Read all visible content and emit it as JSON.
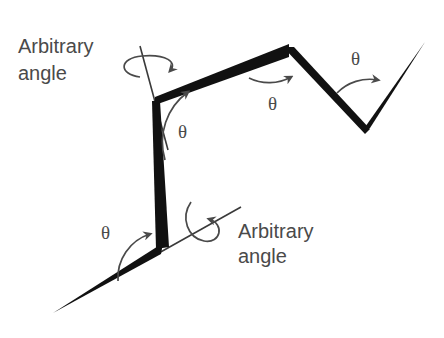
{
  "figure": {
    "background_color": "#ffffff",
    "chain_color": "#111111",
    "annotation_color": "#4a4a4a",
    "width": 444,
    "height": 338
  },
  "labels": {
    "arbitrary_top": {
      "line1": "Arbitrary",
      "line2": "angle",
      "x": 18,
      "y1": 53,
      "y2": 80
    },
    "arbitrary_bottom": {
      "line1": "Arbitrary",
      "line2": "angle",
      "x": 238,
      "y1": 238,
      "y2": 263
    },
    "theta_symbol": "θ",
    "thetas": [
      {
        "name": "theta-lower-joint",
        "x": 101,
        "y": 239
      },
      {
        "name": "theta-upper-joint",
        "x": 178,
        "y": 138
      },
      {
        "name": "theta-peak-joint",
        "x": 268,
        "y": 110
      },
      {
        "name": "theta-valley-joint",
        "x": 351,
        "y": 65
      }
    ]
  },
  "chain": {
    "vertices": [
      {
        "name": "tail-end-lower-left",
        "x": 53,
        "y": 313
      },
      {
        "name": "joint-lower",
        "x": 162,
        "y": 248
      },
      {
        "name": "joint-upper",
        "x": 155,
        "y": 100
      },
      {
        "name": "joint-peak",
        "x": 288,
        "y": 50
      },
      {
        "name": "joint-valley",
        "x": 367,
        "y": 130
      },
      {
        "name": "tail-end-upper-right",
        "x": 425,
        "y": 42
      }
    ],
    "segment_widths": [
      8,
      9,
      8,
      7,
      8
    ]
  },
  "rotation_axes": [
    {
      "name": "axis-upper",
      "x1": 140,
      "y1": 46,
      "x2": 168,
      "y2": 150
    },
    {
      "name": "axis-lower",
      "x1": 142,
      "y1": 262,
      "x2": 240,
      "y2": 208
    }
  ]
}
